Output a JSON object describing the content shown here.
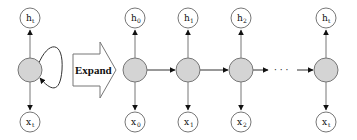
{
  "diagram": {
    "expand_label": "Expand",
    "colors": {
      "hidden_fill": "#d4d4d4",
      "io_fill": "#ffffff",
      "stroke": "#777777",
      "arrow": "#111111"
    },
    "folded": {
      "output": {
        "base": "h",
        "sub": "t"
      },
      "input": {
        "base": "x",
        "sub": "t"
      }
    },
    "unrolled": [
      {
        "output": {
          "base": "h",
          "sub": "0"
        },
        "input": {
          "base": "x",
          "sub": "0"
        }
      },
      {
        "output": {
          "base": "h",
          "sub": "1"
        },
        "input": {
          "base": "x",
          "sub": "1"
        }
      },
      {
        "output": {
          "base": "h",
          "sub": "2"
        },
        "input": {
          "base": "x",
          "sub": "2"
        }
      },
      {
        "output": {
          "base": "h",
          "sub": "t"
        },
        "input": {
          "base": "x",
          "sub": "t"
        }
      }
    ],
    "ellipsis": "· · ·"
  }
}
